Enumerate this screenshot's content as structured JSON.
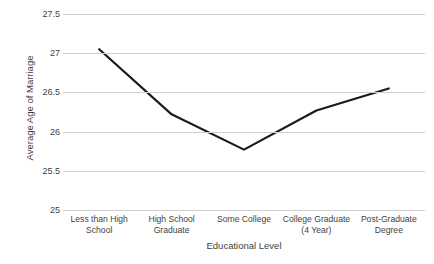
{
  "chart_data": {
    "type": "line",
    "title": "",
    "subtitle": "",
    "xlabel": "Educational Level",
    "ylabel": "Average Age of Marriage",
    "categories": [
      "Less than High School",
      "High School Graduate",
      "Some College",
      "College Graduate (4 Year)",
      "Post-Graduate Degree"
    ],
    "values": [
      27.05,
      26.22,
      25.77,
      26.27,
      26.55
    ],
    "series": [
      {
        "name": "Average Age of Marriage",
        "values": [
          27.05,
          26.22,
          25.77,
          26.27,
          26.55
        ]
      }
    ],
    "ylim": [
      25,
      27.5
    ],
    "yticks": [
      27.5,
      27,
      26.5,
      26,
      25.5,
      25
    ],
    "ytick_labels": [
      "27.5",
      "27",
      "26.5",
      "26",
      "25.5",
      "25"
    ],
    "grid": true,
    "grid_axis": "y",
    "legend": false,
    "legend_position": "none",
    "line_color": "#1a1a1a",
    "line_width": 2.2,
    "grid_color": "#d0d0d0",
    "background_color": "#ffffff",
    "text_color": "#3f3f3f",
    "markers": false
  }
}
